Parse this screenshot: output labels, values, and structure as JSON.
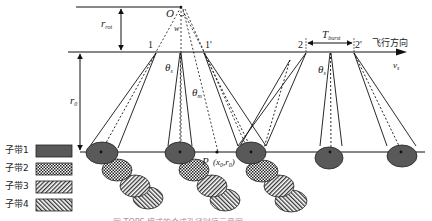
{
  "figure": {
    "type": "TOPS SAR acquisition geometry diagram",
    "labels": {
      "origin": "O",
      "omega": "w",
      "r_rot": "r",
      "r_rot_sub": "rot",
      "r_0": "r",
      "r_0_sub": "0",
      "theta_s": "θ",
      "theta_s_sub": "s",
      "theta_m": "θ",
      "theta_m_sub": "m",
      "point_1": "1",
      "point_1p": "1'",
      "point_2": "2",
      "point_2p": "2'",
      "t_burst": "T",
      "t_burst_sub": "burst",
      "flight_direction": "飞行方向",
      "velocity": "v",
      "velocity_sub": "s",
      "target": "P",
      "target_coords": "(x",
      "target_coords_sub": "0",
      "target_coords_tail": ",r",
      "target_coords_sub2": "0",
      "target_close": ")"
    },
    "legend": [
      {
        "label": "子带1",
        "pattern": "solid-dark",
        "color": "#555555"
      },
      {
        "label": "子带2",
        "pattern": "checker",
        "color": "#333333"
      },
      {
        "label": "子带3",
        "pattern": "diagonal-forward",
        "color": "#333333"
      },
      {
        "label": "子带4",
        "pattern": "diagonal-back",
        "color": "#333333"
      }
    ],
    "caption": "图    TOPS 模式的合成孔径时序示意图"
  }
}
